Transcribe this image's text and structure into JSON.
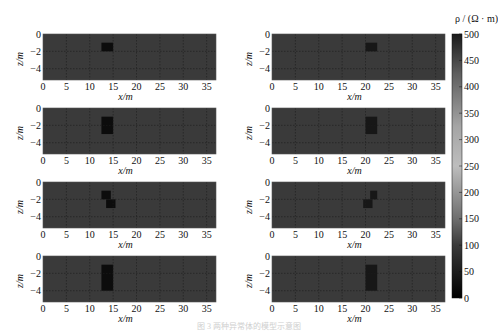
{
  "chart_data": {
    "type": "heatmap",
    "colormap": "gray",
    "colorbar": {
      "label": "ρ / (Ω · m)",
      "range": [
        0,
        500
      ],
      "ticks": [
        0,
        50,
        100,
        150,
        200,
        250,
        300,
        350,
        400,
        450,
        500
      ]
    },
    "background_value": 100,
    "xlim": [
      0,
      37
    ],
    "ylim": [
      -5.3,
      0
    ],
    "xticks": [
      0,
      5,
      10,
      15,
      20,
      25,
      30,
      35
    ],
    "yticks": [
      0,
      -2,
      -4
    ],
    "xlabel": "x/m",
    "ylabel": "z/m",
    "grid": true,
    "panels": [
      {
        "id": "left-1",
        "column": "left",
        "row": 1,
        "anomalies": [
          {
            "x": [
              12.5,
              15
            ],
            "z": [
              -1,
              -2
            ],
            "value": 20
          }
        ]
      },
      {
        "id": "right-1",
        "column": "right",
        "row": 1,
        "anomalies": [
          {
            "x": [
              20,
              22.5
            ],
            "z": [
              -1,
              -2
            ],
            "value": 40
          }
        ]
      },
      {
        "id": "left-2",
        "column": "left",
        "row": 2,
        "anomalies": [
          {
            "x": [
              12.5,
              15
            ],
            "z": [
              -1,
              -3
            ],
            "value": 20
          }
        ]
      },
      {
        "id": "right-2",
        "column": "right",
        "row": 2,
        "anomalies": [
          {
            "x": [
              20,
              22.5
            ],
            "z": [
              -1,
              -3
            ],
            "value": 40
          }
        ]
      },
      {
        "id": "left-3",
        "column": "left",
        "row": 3,
        "anomalies": [
          {
            "x": [
              12.5,
              14.5
            ],
            "z": [
              -1,
              -2
            ],
            "value": 20
          },
          {
            "x": [
              13.5,
              15.5
            ],
            "z": [
              -2,
              -3
            ],
            "value": 20
          }
        ]
      },
      {
        "id": "right-3",
        "column": "right",
        "row": 3,
        "anomalies": [
          {
            "x": [
              21,
              22.5
            ],
            "z": [
              -1,
              -2
            ],
            "value": 40
          },
          {
            "x": [
              19.5,
              21.5
            ],
            "z": [
              -2,
              -3
            ],
            "value": 40
          }
        ]
      },
      {
        "id": "left-4",
        "column": "left",
        "row": 4,
        "anomalies": [
          {
            "x": [
              12.5,
              15
            ],
            "z": [
              -1,
              -4
            ],
            "value": 20
          }
        ]
      },
      {
        "id": "right-4",
        "column": "right",
        "row": 4,
        "anomalies": [
          {
            "x": [
              20,
              22.5
            ],
            "z": [
              -1,
              -4
            ],
            "value": 40
          }
        ]
      }
    ]
  },
  "caption": "图 3  两种异常体的模型示意图"
}
